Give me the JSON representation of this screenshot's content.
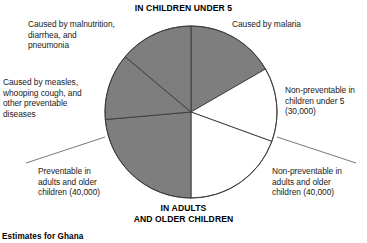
{
  "headers": {
    "top": "IN CHILDREN UNDER 5",
    "bottom": "IN ADULTS\nAND OLDER CHILDREN"
  },
  "caption": "Estimates for Ghana",
  "labels": {
    "malnutrition": "Caused by malnutrition,\ndiarrhea, and\npneumonia",
    "malaria": "Caused by malaria",
    "measles": "Caused by measles,\nwhooping cough, and\nother preventable\ndiseases",
    "nonpreventable_children": "Non-preventable in\nchildren under 5\n(30,000)",
    "preventable_adults": "Preventable in\nadults and older\nchildren (40,000)",
    "nonpreventable_adults": "Non-preventable in\nadults and older\nchildren (40,000)"
  },
  "colors": {
    "shaded": "#7e7e7e",
    "unshaded": "#ffffff",
    "outline": "#3a3a3a",
    "leader": "#555555",
    "text": "#1a1a1a"
  },
  "chart_data": {
    "type": "pie",
    "xlabel": "",
    "ylabel": "",
    "legend_position": "callout-labels",
    "grid": false,
    "units": "deaths",
    "center": {
      "x": 191,
      "y": 112
    },
    "radius": 86,
    "start_angle_deg": -90,
    "direction": "clockwise",
    "categories": [
      "Caused by malaria",
      "Non-preventable in children under 5 (30,000)",
      "Non-preventable in adults and older children (40,000)",
      "Preventable in adults and older children (40,000)",
      "Caused by measles, whooping cough, and other preventable diseases",
      "Caused by malnutrition, diarrhea, and pneumonia"
    ],
    "values": [
      60,
      50,
      70,
      85,
      45,
      50
    ],
    "value_units": "degrees of arc",
    "labeled_values": [
      {
        "category": "Non-preventable in children under 5",
        "value": 30000,
        "label": "(30,000)"
      },
      {
        "category": "Non-preventable in adults and older children",
        "value": 40000,
        "label": "(40,000)"
      },
      {
        "category": "Preventable in adults and older children",
        "value": 40000,
        "label": "(40,000)"
      }
    ],
    "slices": [
      {
        "name": "Caused by malaria",
        "start_deg": -90,
        "end_deg": -30,
        "shaded": true,
        "group": "children-under-5"
      },
      {
        "name": "Non-preventable in children under 5 (30,000)",
        "start_deg": -30,
        "end_deg": 20,
        "shaded": false,
        "group": "children-under-5"
      },
      {
        "name": "Non-preventable in adults and older children (40,000)",
        "start_deg": 20,
        "end_deg": 90,
        "shaded": false,
        "group": "adults-and-older-children"
      },
      {
        "name": "Preventable in adults and older children (40,000)",
        "start_deg": 90,
        "end_deg": 175,
        "shaded": true,
        "group": "adults-and-older-children"
      },
      {
        "name": "Caused by measles, whooping cough, and other preventable diseases",
        "start_deg": 175,
        "end_deg": 220,
        "shaded": true,
        "group": "children-under-5"
      },
      {
        "name": "Caused by malnutrition, diarrhea, and pneumonia",
        "start_deg": 220,
        "end_deg": 270,
        "shaded": true,
        "group": "children-under-5"
      }
    ]
  }
}
